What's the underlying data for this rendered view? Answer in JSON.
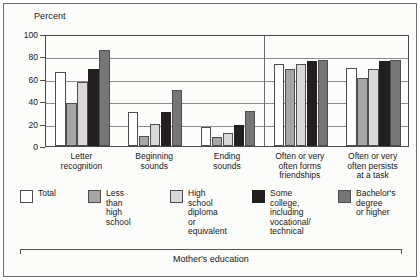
{
  "figure": {
    "ylabel": "Percent",
    "bottom_label": "Mother's education"
  },
  "legend": [
    {
      "label": "Total",
      "color": "#ffffff"
    },
    {
      "label": "Less than\nhigh school",
      "color": "#a6a6a6"
    },
    {
      "label": "High school\ndiploma\nor equivalent",
      "color": "#d8d8d8"
    },
    {
      "label": "Some college,\nincluding\nvocational/\ntechnical",
      "color": "#231f20"
    },
    {
      "label": "Bachelor's\ndegree\nor higher",
      "color": "#767676"
    }
  ],
  "chart_data": {
    "type": "bar",
    "title": "",
    "xlabel": "Mother's education",
    "ylabel": "Percent",
    "ylim": [
      0,
      100
    ],
    "yticks": [
      0,
      20,
      40,
      60,
      80,
      100
    ],
    "grid": true,
    "legend_position": "below-axes",
    "categories": [
      "Letter recognition",
      "Beginning sounds",
      "Ending sounds",
      "Often or very often forms friendships",
      "Often or very often persists at a task"
    ],
    "series": [
      {
        "name": "Total",
        "color": "#ffffff",
        "values": [
          66,
          30,
          17,
          73,
          70
        ]
      },
      {
        "name": "Less than high school",
        "color": "#a6a6a6",
        "values": [
          38,
          9,
          8,
          69,
          61
        ]
      },
      {
        "name": "High school diploma or equivalent",
        "color": "#d8d8d8",
        "values": [
          57,
          20,
          12,
          73,
          69
        ]
      },
      {
        "name": "Some college, including vocational/technical",
        "color": "#231f20",
        "values": [
          69,
          30,
          19,
          76,
          76
        ]
      },
      {
        "name": "Bachelor's degree or higher",
        "color": "#767676",
        "values": [
          86,
          50,
          31,
          77,
          77
        ]
      }
    ]
  }
}
